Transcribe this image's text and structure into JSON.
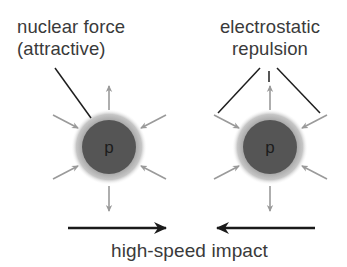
{
  "labels": {
    "nuclear_force": [
      "nuclear force",
      "(attractive)"
    ],
    "electrostatic": [
      "electrostatic",
      "repulsion"
    ],
    "impact": "high-speed impact"
  },
  "protons": [
    {
      "symbol": "p",
      "cx": 109,
      "cy": 147
    },
    {
      "symbol": "p",
      "cx": 270,
      "cy": 147
    }
  ],
  "colors": {
    "core": "#555555",
    "halo": "#b3b3b3",
    "force_arrow": "#9a9a9a",
    "leader_line": "#1e1e1e",
    "impact_arrow": "#1a1a1a",
    "text": "#3a3a3a"
  }
}
